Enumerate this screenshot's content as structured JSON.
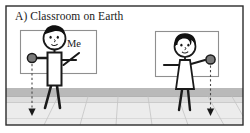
{
  "figure": {
    "panel_label": "A) Classroom on Earth",
    "annotations": {
      "self_label": "Me"
    },
    "colors": {
      "outline": "#1a1a1a",
      "border": "#2b2b2b",
      "ball_fill": "#7a7a7a",
      "hair_fill": "#111111",
      "skin_fill": "#ffffff",
      "wall_fill": "#ffffff",
      "floor_band_dark": "#b9b9b9",
      "floor_band_light": "#e8e8e8",
      "floor_line": "#c9c9c9",
      "frame_line": "#8c8c8c",
      "arrow_dash": "#555555"
    },
    "scene": {
      "caption_position": "top-left",
      "wall_frames": 2,
      "people": [
        {
          "id": "left-person",
          "role": "student-self",
          "label": "Me",
          "holds_ball": true,
          "ball_hand": "left",
          "arrow_direction": "down",
          "clothing": "shirt-and-pants"
        },
        {
          "id": "right-person",
          "role": "student-other",
          "label": "",
          "holds_ball": true,
          "ball_hand": "right",
          "arrow_direction": "down",
          "clothing": "dress"
        }
      ],
      "force_arrows": [
        {
          "id": "left-gravity-arrow",
          "direction": "down",
          "style": "dashed"
        },
        {
          "id": "right-gravity-arrow",
          "direction": "down",
          "style": "dashed"
        }
      ]
    }
  }
}
